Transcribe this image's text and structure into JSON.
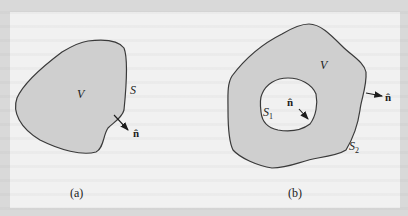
{
  "figure": {
    "panel_a": {
      "caption": "(a)",
      "volume_label": "V",
      "surface_label": "S",
      "normal_label": "n̂"
    },
    "panel_b": {
      "caption": "(b)",
      "volume_label": "V",
      "inner_surface_label": "S",
      "inner_surface_sub": "1",
      "outer_surface_label": "S",
      "outer_surface_sub": "2",
      "inner_normal_label": "n̂",
      "outer_normal_label": "n̂"
    },
    "colors": {
      "region_fill": "#cfcfcf",
      "outline": "#3a3a3a",
      "background": "#f1f1f1",
      "border": "#d9d9d9"
    }
  }
}
